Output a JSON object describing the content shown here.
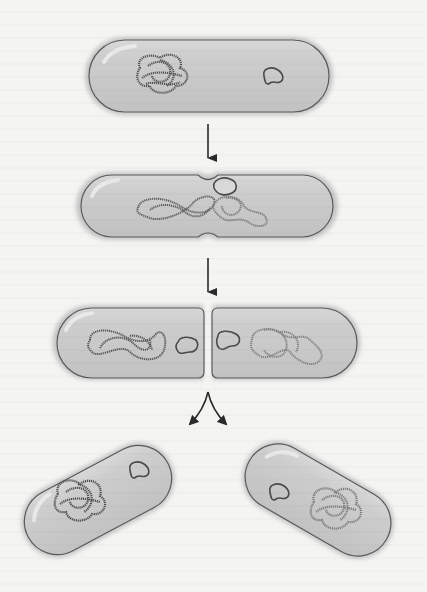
{
  "figure": {
    "title": "",
    "stages": [
      {
        "id": "stage-1",
        "label": "",
        "description": "Parent cell with single chromosome and one plasmid"
      },
      {
        "id": "stage-2",
        "label": "",
        "description": "Chromosome replicating, cell constricting at midline"
      },
      {
        "id": "stage-3",
        "label": "",
        "description": "Septum formed; each half holds a chromosome and a plasmid"
      },
      {
        "id": "stage-4",
        "label": "",
        "description": "Two separated daughter cells"
      }
    ],
    "arrows": [
      {
        "id": "arrow-1",
        "type": "down"
      },
      {
        "id": "arrow-2",
        "type": "down"
      },
      {
        "id": "arrow-3",
        "type": "split"
      }
    ]
  },
  "colors": {
    "background": "#f4f4f3",
    "cell_fill": "#c9c9c9",
    "cell_highlight": "#e6e6e6",
    "cell_halo": "#b4b4b4",
    "membrane": "#5a5a5a",
    "chromosome_dark": "#555555",
    "chromosome_light": "#8a8a8a",
    "plasmid": "#4a4a4a",
    "arrow": "#2a2a2a"
  }
}
